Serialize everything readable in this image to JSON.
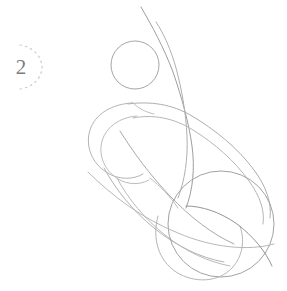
{
  "page": {
    "background_color": "#ffffff",
    "width": 287,
    "height": 291
  },
  "step_badge": {
    "number": "2",
    "number_color": "#7d7d7d",
    "arc_color": "#c9c9c9",
    "arc_style": "dashed-partial-circle",
    "arc_dash": "1.5 4"
  },
  "sketch": {
    "description": "Light pencil construction sketch of an animal figure: a circular head shape at upper left, two long sweeping neck curves rising to the top edge, and elongated overlapping oval body masses running diagonally down to the lower right, ending in a rounded hindquarter.",
    "line_color_light": "#c2c2c2",
    "line_color_mid": "#a8a8a8",
    "line_color_dark": "#8f8f8f",
    "stroke_width": 1,
    "shapes": [
      {
        "name": "head-circle",
        "type": "circle",
        "cx": 135,
        "cy": 65,
        "r": 24
      },
      {
        "name": "neck-curve-outer",
        "type": "path"
      },
      {
        "name": "neck-curve-inner",
        "type": "path"
      },
      {
        "name": "body-oval-upper",
        "type": "ellipse"
      },
      {
        "name": "body-oval-lower",
        "type": "ellipse"
      },
      {
        "name": "shoulder-loop",
        "type": "path"
      },
      {
        "name": "haunch-circle",
        "type": "circle",
        "cx": 221,
        "cy": 225,
        "r": 53
      },
      {
        "name": "rump-curve",
        "type": "path"
      },
      {
        "name": "belly-curve",
        "type": "path"
      },
      {
        "name": "center-axis-curve",
        "type": "path"
      }
    ]
  }
}
